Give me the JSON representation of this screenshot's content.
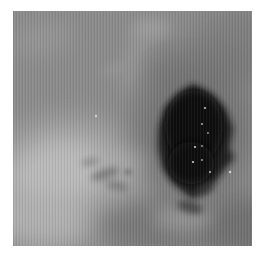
{
  "page": {
    "width": 268,
    "height": 257,
    "background": "#ffffff"
  },
  "photo": {
    "description": "Grayscale printed photograph of a mottled gray surface with a dark irregular blob right of center, a bright cloudy region at lower left, tiny white specks inside the blob, and fine vertical print-scan striping",
    "left": 13,
    "top": 11,
    "width": 239,
    "height": 235,
    "base_color": "#8c8c8c",
    "blob_color": "#0b0b0b",
    "highlight_color": "#bebebe",
    "speck_color": "#d8d8d8",
    "texture": {
      "stripe_period_px": 3,
      "stripe_dark": "rgba(0,0,0,0.07)",
      "stripe_light": "rgba(255,255,255,0.05)"
    },
    "shapes": [
      {
        "kind": "rect",
        "x": 0,
        "y": 0,
        "w": 239,
        "h": 235,
        "fill": "#8c8c8c",
        "op": 1
      },
      {
        "kind": "ellipse",
        "cx": 228,
        "cy": 32,
        "rx": 48,
        "ry": 38,
        "rot": 0,
        "fill": "#7d7d7d",
        "blur": 14,
        "op": 0.75
      },
      {
        "kind": "ellipse",
        "cx": 30,
        "cy": 28,
        "rx": 32,
        "ry": 16,
        "rot": -10,
        "fill": "#989898",
        "blur": 10,
        "op": 0.8
      },
      {
        "kind": "ellipse",
        "cx": 138,
        "cy": 18,
        "rx": 20,
        "ry": 10,
        "rot": 0,
        "fill": "#a2a2a2",
        "blur": 7,
        "op": 0.85
      },
      {
        "kind": "ellipse",
        "cx": 122,
        "cy": 48,
        "rx": 10,
        "ry": 36,
        "rot": 18,
        "fill": "#9c9c9c",
        "blur": 8,
        "op": 0.75
      },
      {
        "kind": "ellipse",
        "cx": 100,
        "cy": 58,
        "rx": 13,
        "ry": 5,
        "rot": -25,
        "fill": "#9a9a9a",
        "blur": 5,
        "op": 0.7
      },
      {
        "kind": "ellipse",
        "cx": 185,
        "cy": 58,
        "rx": 55,
        "ry": 26,
        "rot": -5,
        "fill": "#787878",
        "blur": 12,
        "op": 0.8
      },
      {
        "kind": "ellipse",
        "cx": 55,
        "cy": 168,
        "rx": 78,
        "ry": 62,
        "rot": 0,
        "fill": "#a9a9a9",
        "blur": 14,
        "op": 0.9
      },
      {
        "kind": "ellipse",
        "cx": 45,
        "cy": 162,
        "rx": 46,
        "ry": 32,
        "rot": -12,
        "fill": "#bebebe",
        "blur": 10,
        "op": 0.9
      },
      {
        "kind": "ellipse",
        "cx": 28,
        "cy": 208,
        "rx": 48,
        "ry": 28,
        "rot": 0,
        "fill": "#b4b4b4",
        "blur": 12,
        "op": 0.85
      },
      {
        "kind": "ellipse",
        "cx": 112,
        "cy": 150,
        "rx": 30,
        "ry": 11,
        "rot": -8,
        "fill": "#adadad",
        "blur": 7,
        "op": 0.8
      },
      {
        "kind": "ellipse",
        "cx": 92,
        "cy": 163,
        "rx": 15,
        "ry": 4.5,
        "rot": -18,
        "fill": "#6c6c6c",
        "blur": 3,
        "op": 0.75
      },
      {
        "kind": "ellipse",
        "cx": 104,
        "cy": 175,
        "rx": 12,
        "ry": 4,
        "rot": 12,
        "fill": "#6c6c6c",
        "blur": 3,
        "op": 0.65
      },
      {
        "kind": "ellipse",
        "cx": 77,
        "cy": 151,
        "rx": 9,
        "ry": 3.5,
        "rot": -10,
        "fill": "#737373",
        "blur": 3,
        "op": 0.6
      },
      {
        "kind": "ellipse",
        "cx": 115,
        "cy": 161,
        "rx": 4,
        "ry": 3,
        "rot": 0,
        "fill": "#6a6a6a",
        "blur": 2,
        "op": 0.7
      },
      {
        "kind": "ellipse",
        "cx": 140,
        "cy": 216,
        "rx": 58,
        "ry": 28,
        "rot": 3,
        "fill": "#767676",
        "blur": 12,
        "op": 0.85
      },
      {
        "kind": "ellipse",
        "cx": 226,
        "cy": 216,
        "rx": 42,
        "ry": 32,
        "rot": 0,
        "fill": "#6d6d6d",
        "blur": 12,
        "op": 0.85
      },
      {
        "kind": "ellipse",
        "cx": 226,
        "cy": 146,
        "rx": 18,
        "ry": 24,
        "rot": 0,
        "fill": "#8f8f8f",
        "blur": 8,
        "op": 0.8
      },
      {
        "kind": "ellipse",
        "cx": 170,
        "cy": 207,
        "rx": 30,
        "ry": 13,
        "rot": 0,
        "fill": "#9b9b9b",
        "blur": 8,
        "op": 0.8
      },
      {
        "kind": "ellipse",
        "cx": 181,
        "cy": 122,
        "rx": 58,
        "ry": 64,
        "rot": 0,
        "fill": "#6e6e6e",
        "blur": 15,
        "op": 0.85
      },
      {
        "kind": "polygon",
        "points": "180,73 199,84 212,97 220,117 216,137 221,147 211,159 202,171 190,181 180,188 170,181 159,171 150,157 145,137 146,117 152,97 167,82",
        "fill": "#1d1d1d",
        "blur": 3,
        "op": 0.97
      },
      {
        "kind": "ellipse",
        "cx": 181,
        "cy": 116,
        "rx": 29,
        "ry": 37,
        "rot": 0,
        "fill": "#0b0b0b",
        "blur": 4,
        "op": 1
      },
      {
        "kind": "ellipse",
        "cx": 178,
        "cy": 152,
        "rx": 23,
        "ry": 21,
        "rot": 0,
        "fill": "#0e0e0e",
        "blur": 4,
        "op": 1
      },
      {
        "kind": "ellipse",
        "cx": 177,
        "cy": 196,
        "rx": 13,
        "ry": 6,
        "rot": 15,
        "fill": "#3a3a3a",
        "blur": 3,
        "op": 0.8
      },
      {
        "kind": "ellipse",
        "cx": 192,
        "cy": 178,
        "rx": 10,
        "ry": 5,
        "rot": -30,
        "fill": "#333333",
        "blur": 3,
        "op": 0.8
      },
      {
        "kind": "circle",
        "cx": 192,
        "cy": 97,
        "r": 1.1,
        "fill": "#cfcfcf",
        "op": 0.95
      },
      {
        "kind": "circle",
        "cx": 189,
        "cy": 113,
        "r": 1.0,
        "fill": "#c8c8c8",
        "op": 0.9
      },
      {
        "kind": "circle",
        "cx": 195,
        "cy": 122,
        "r": 0.9,
        "fill": "#bfbfbf",
        "op": 0.85
      },
      {
        "kind": "circle",
        "cx": 182,
        "cy": 136,
        "r": 1.1,
        "fill": "#d6d6d6",
        "op": 0.95
      },
      {
        "kind": "circle",
        "cx": 189,
        "cy": 135,
        "r": 0.9,
        "fill": "#c4c4c4",
        "op": 0.85
      },
      {
        "kind": "circle",
        "cx": 180,
        "cy": 151,
        "r": 1.1,
        "fill": "#dcdcdc",
        "op": 0.95
      },
      {
        "kind": "circle",
        "cx": 189,
        "cy": 149,
        "r": 0.9,
        "fill": "#cccccc",
        "op": 0.9
      },
      {
        "kind": "circle",
        "cx": 197,
        "cy": 161,
        "r": 1.0,
        "fill": "#d2d2d2",
        "op": 0.9
      },
      {
        "kind": "circle",
        "cx": 217,
        "cy": 161,
        "r": 1.2,
        "fill": "#e2e2e2",
        "op": 0.95
      },
      {
        "kind": "circle",
        "cx": 83,
        "cy": 105,
        "r": 1.2,
        "fill": "#d8d8d8",
        "op": 0.9
      }
    ]
  }
}
